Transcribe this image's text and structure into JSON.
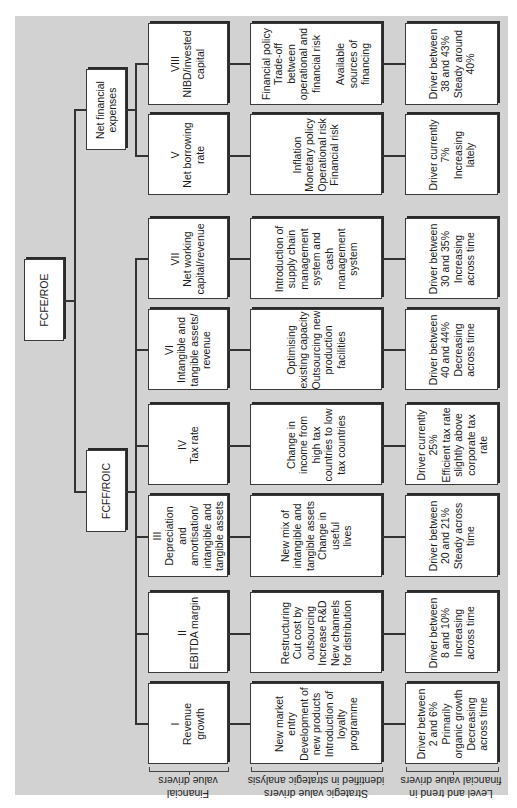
{
  "diagram": {
    "root": "FCFE/ROE",
    "branches": {
      "net_financial_expenses": "Net financial expenses",
      "fcff_roic": "FCFF/ROIC"
    },
    "rows": [
      {
        "id": "VIII",
        "driver": "VIII\nNIBD/invested\ncapital",
        "strategic": "Financial policy\nTrade-off\nbetween\noperational and\nfinancial risk\n\nAvailable\nsources of\nfinancing",
        "trend": "Driver between\n38 and 43%\nSteady around\n40%"
      },
      {
        "id": "V",
        "driver": "V\nNet borrowing\nrate",
        "strategic": "Inflation\nMonetary policy\nOperational risk\nFinancial risk",
        "trend": "Driver currently\n7%\nIncreasing\nlately"
      },
      {
        "id": "VII",
        "driver": "VII\nNet working\ncapital/revenue",
        "strategic": "Introduction of\nsupply chain\nmanagement\nsystem and\ncash\nmanagement\nsystem",
        "trend": "Driver between\n30 and 35%\nIncreasing\nacross time"
      },
      {
        "id": "VI",
        "driver": "VI\nIntangible and\ntangible assets/\nrevenue",
        "strategic": "Optimising\nexisting capacity\nOutsourcing new\nproduction\nfacilities",
        "trend": "Driver between\n40 and 44%\nDecreasing\nacross time"
      },
      {
        "id": "IV",
        "driver": "IV\nTax rate",
        "strategic": "Change in\nincome from\nhigh tax\ncountries to low\ntax countries",
        "trend": "Driver currently\n25%\nEfficient tax rate\nslightly above\ncorporate tax\nrate"
      },
      {
        "id": "III",
        "driver": "III\nDepreciation\nand\namortisation/\nintangible and\ntangible assets",
        "strategic": "New mix of\nintangible and\ntangible assets\nChange in\nuseful\nlives",
        "trend": "Driver between\n20 and 21%\nSteady across\ntime"
      },
      {
        "id": "II",
        "driver": "II\nEBITDA margin",
        "strategic": "Restructuring\nCut cost by\noutsourcing\nIncrease R&D\nNew channels\nfor distribution",
        "trend": "Driver between\n8 and 10%\nIncreasing\nacross time"
      },
      {
        "id": "I",
        "driver": "I\nRevenue\ngrowth",
        "strategic": "New market\nentry\nDevelopment of\nnew products\nIntroduction of\nloyalty\nprogramme",
        "trend": "Driver between\n2 and 6%\nPrimarily\norganic growth\nDecreasing\nacross time"
      }
    ],
    "column_labels": {
      "financial": "Financial\nvalue drivers",
      "strategic": "Strategic value drivers\nidentified in strategic analysis",
      "trend": "Level and trend in\nfinancial value drivers"
    }
  }
}
